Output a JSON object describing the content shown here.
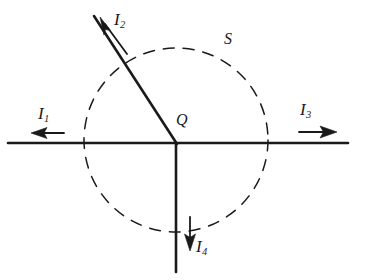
{
  "figure": {
    "line_color": "#1a1a1a",
    "background_color": "#ffffff",
    "junction": {
      "label": "Q",
      "x": 176,
      "y": 143
    },
    "surface": {
      "label": "S",
      "style": "dashed-circle",
      "center_x": 176,
      "center_y": 140,
      "radius": 92,
      "label_x": 224,
      "label_y": 31
    },
    "currents": [
      {
        "name": "I",
        "subscript": "1",
        "label": "I1",
        "direction": "left",
        "arrow_from_x": 63,
        "arrow_from_y": 133,
        "arrow_to_x": 31,
        "arrow_to_y": 133,
        "label_x": 38,
        "label_y": 105
      },
      {
        "name": "I",
        "subscript": "2",
        "label": "I2",
        "direction": "up-left",
        "arrow_from_x": 126,
        "arrow_from_y": 53,
        "arrow_to_x": 101,
        "arrow_to_y": 19,
        "label_x": 114,
        "label_y": 11
      },
      {
        "name": "I",
        "subscript": "3",
        "label": "I3",
        "direction": "right",
        "arrow_from_x": 299,
        "arrow_from_y": 132,
        "arrow_to_x": 336,
        "arrow_to_y": 132,
        "label_x": 300,
        "label_y": 101
      },
      {
        "name": "I",
        "subscript": "4",
        "label": "I4",
        "direction": "down",
        "arrow_from_x": 190,
        "arrow_from_y": 218,
        "arrow_to_x": 190,
        "arrow_to_y": 250,
        "label_x": 196,
        "label_y": 238
      }
    ],
    "wires": [
      {
        "name": "wire-horizontal",
        "x1": 8,
        "y1": 143,
        "x2": 348,
        "y2": 143
      },
      {
        "name": "wire-diagonal",
        "x1": 176,
        "y1": 143,
        "x2": 94,
        "y2": 16
      },
      {
        "name": "wire-vertical",
        "x1": 176,
        "y1": 143,
        "x2": 176,
        "y2": 272
      }
    ]
  }
}
